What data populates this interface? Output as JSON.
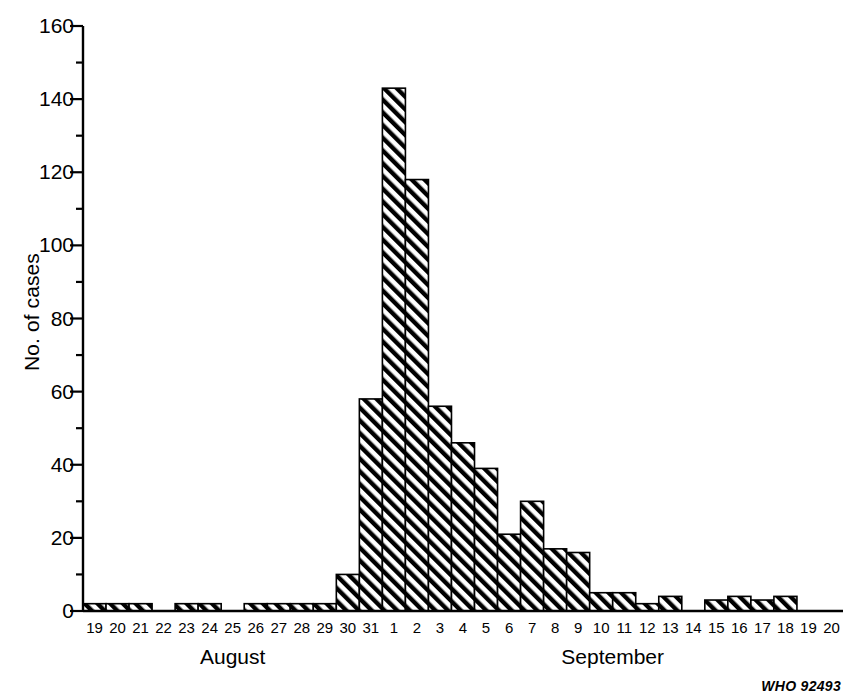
{
  "chart_data": {
    "type": "bar",
    "title": "",
    "subtitle": "",
    "xlabel": "",
    "ylabel": "No. of cases",
    "ylim": [
      0,
      160
    ],
    "ytick_values": [
      0,
      20,
      40,
      60,
      80,
      100,
      120,
      140,
      160
    ],
    "ytick_labels": [
      "0",
      "20",
      "40",
      "60",
      "80",
      "100",
      "120",
      "140",
      "160"
    ],
    "yminor_interval": 10,
    "grid": false,
    "legend": null,
    "categories": [
      "19",
      "20",
      "21",
      "22",
      "23",
      "24",
      "25",
      "26",
      "27",
      "28",
      "29",
      "30",
      "31",
      "1",
      "2",
      "3",
      "4",
      "5",
      "6",
      "7",
      "8",
      "9",
      "10",
      "11",
      "12",
      "13",
      "14",
      "15",
      "16",
      "17",
      "18",
      "19",
      "20"
    ],
    "values": [
      2,
      2,
      2,
      0,
      2,
      2,
      0,
      2,
      2,
      2,
      2,
      10,
      58,
      143,
      118,
      56,
      46,
      39,
      21,
      30,
      17,
      16,
      5,
      5,
      2,
      4,
      0,
      3,
      4,
      3,
      4,
      0,
      0
    ],
    "bar_fill": "diagonal-hatch",
    "bar_color": "#000000",
    "groups": [
      {
        "label": "August",
        "start_index": 0,
        "end_index": 12
      },
      {
        "label": "September",
        "start_index": 13,
        "end_index": 32
      }
    ],
    "annotations": [
      {
        "name": "credit",
        "text": "WHO 92493"
      }
    ]
  },
  "axes": {
    "y_axis_label": "No. of cases",
    "x_axis_label": ""
  },
  "credit": {
    "text": "WHO 92493"
  }
}
